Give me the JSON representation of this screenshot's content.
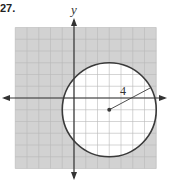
{
  "problem": {
    "number": "27."
  },
  "axes": {
    "y_label": "y",
    "x_label": ""
  },
  "colors": {
    "shade": "#d2d2d2",
    "grid": "#b8b8b8",
    "axis": "#333333",
    "circle": "#3a3a3a",
    "background": "#ffffff"
  },
  "grid": {
    "xmin": -5,
    "xmax": 7,
    "ymin": -6,
    "ymax": 6,
    "step": 1
  },
  "circle": {
    "center": [
      3,
      -1
    ],
    "radius": 4,
    "radius_label": "4",
    "shading": "outside",
    "boundary": "solid"
  }
}
